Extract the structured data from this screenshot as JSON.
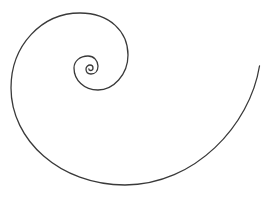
{
  "diagram": {
    "background": "#ffffff",
    "stroke_color": "#3a3a3a",
    "stroke_width": 1.3,
    "path": "M 259.5 66 C 250 125 195 185 125 185 C 60 185 11 140 11 88 C 11 45 42 13 80 13 C 110 13 128 32 128 55 C 128 75 113 90 98 90 C 84 90 74 80 74 68 C 74 61 80 56 88 56 C 94 56 98 61 98 66 C 98 71 95 74 91 74 C 88 74 86 72 86 69 C 86 67 88 65 90 65 C 92 65 93 66.5 93 68 C 93 69.5 92 70.5 90.5 70.5 C 89.5 70.5 88.8 69.8 88.8 68.8"
  }
}
